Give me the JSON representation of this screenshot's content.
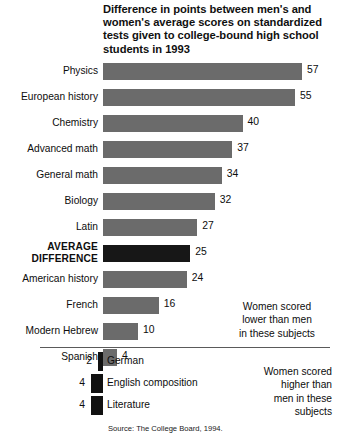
{
  "title": "Difference in points between men's and women's average scores on standardized tests given to college-bound high school students in 1993",
  "source": "Source: The College Board, 1994.",
  "annotations": {
    "lower": "Women scored\nlower than men\nin these subjects",
    "higher": "Women scored\nhigher than\nmen in these\nsubjects"
  },
  "rows": [
    {
      "label": "Physics",
      "value": 57,
      "value_text": "57",
      "emphasis": false
    },
    {
      "label": "European history",
      "value": 55,
      "value_text": "55",
      "emphasis": false
    },
    {
      "label": "Chemistry",
      "value": 40,
      "value_text": "40",
      "emphasis": false
    },
    {
      "label": "Advanced math",
      "value": 37,
      "value_text": "37",
      "emphasis": false
    },
    {
      "label": "General math",
      "value": 34,
      "value_text": "34",
      "emphasis": false
    },
    {
      "label": "Biology",
      "value": 32,
      "value_text": "32",
      "emphasis": false
    },
    {
      "label": "Latin",
      "value": 27,
      "value_text": "27",
      "emphasis": false
    },
    {
      "label": "AVERAGE\nDIFFERENCE",
      "value": 25,
      "value_text": "25",
      "emphasis": true
    },
    {
      "label": "American history",
      "value": 24,
      "value_text": "24",
      "emphasis": false
    },
    {
      "label": "French",
      "value": 16,
      "value_text": "16",
      "emphasis": false
    },
    {
      "label": "Modern Hebrew",
      "value": 10,
      "value_text": "10",
      "emphasis": false
    },
    {
      "label": "Spanish",
      "value": 4,
      "value_text": "4",
      "emphasis": false
    }
  ],
  "negative_rows": [
    {
      "label": "German",
      "value": -2,
      "value_text": "2"
    },
    {
      "label": "English composition",
      "value": -4,
      "value_text": "4"
    },
    {
      "label": "Literature",
      "value": -4,
      "value_text": "4"
    }
  ],
  "colors": {
    "bar": "#6b6b6b",
    "bar_emphasis": "#171717",
    "bar_negative": "#111111",
    "text": "#0d0d0d",
    "background": "#ffffff",
    "divider": "#5a5a5a"
  },
  "chart_data": {
    "type": "bar",
    "title": "Difference in points between men's and women's average scores on standardized tests given to college-bound high school students in 1993",
    "subtitle": "",
    "xlabel": "Difference in points (men's score minus women's score)",
    "ylabel": "Subject",
    "orientation": "horizontal",
    "grid": false,
    "legend": "none",
    "xlim": [
      -10,
      60
    ],
    "categories": [
      "Physics",
      "European history",
      "Chemistry",
      "Advanced math",
      "General math",
      "Biology",
      "Latin",
      "AVERAGE DIFFERENCE",
      "American history",
      "French",
      "Modern Hebrew",
      "Spanish",
      "German",
      "English composition",
      "Literature"
    ],
    "values": [
      57,
      55,
      40,
      37,
      34,
      32,
      27,
      25,
      24,
      16,
      10,
      4,
      -2,
      -4,
      -4
    ],
    "data_labels": [
      "57",
      "55",
      "40",
      "37",
      "34",
      "32",
      "27",
      "25",
      "24",
      "16",
      "10",
      "4",
      "2",
      "4",
      "4"
    ],
    "annotations": [
      "Women scored lower than men in these subjects",
      "Women scored higher than men in these subjects"
    ],
    "source": "Source: The College Board, 1994."
  }
}
